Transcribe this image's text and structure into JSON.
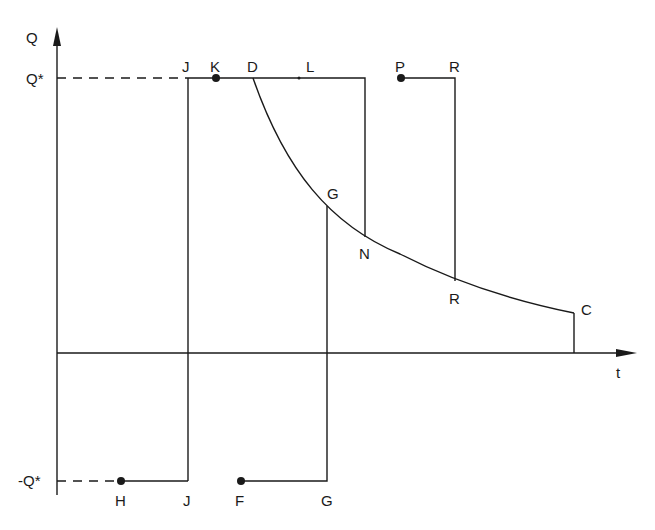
{
  "diagram": {
    "axes": {
      "y_label": "Q",
      "x_label": "t",
      "q_star_label": "Q*",
      "neg_q_star_label": "-Q*"
    },
    "points": {
      "J_top": "J",
      "K": "K",
      "D": "D",
      "L": "L",
      "P": "P",
      "R_top": "R",
      "G_curve": "G",
      "N": "N",
      "R_curve": "R",
      "C": "C",
      "H": "H",
      "J_bottom": "J",
      "F": "F",
      "G_bottom": "G"
    },
    "colors": {
      "stroke": "#1a1a1a",
      "background": "#ffffff"
    }
  }
}
